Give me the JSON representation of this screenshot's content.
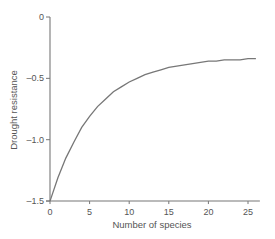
{
  "chart_data": {
    "type": "line",
    "title": "",
    "xlabel": "Number of species",
    "ylabel": "Drought resistance",
    "xlim": [
      0,
      26.5
    ],
    "ylim": [
      -1.5,
      0
    ],
    "xticks": [
      0,
      5,
      10,
      15,
      20,
      25
    ],
    "xtick_labels": [
      "0",
      "5",
      "10",
      "15",
      "20",
      "25"
    ],
    "yticks": [
      0,
      -0.5,
      -1.0,
      -1.5
    ],
    "ytick_labels": [
      "0",
      "–0.5",
      "–1.0",
      "–1.5"
    ],
    "grid": false,
    "legend": null,
    "series": [
      {
        "name": "Drought resistance",
        "color": "#777777",
        "x": [
          0,
          1,
          2,
          3,
          4,
          5,
          6,
          7,
          8,
          9,
          10,
          11,
          12,
          13,
          14,
          15,
          16,
          17,
          18,
          19,
          20,
          21,
          22,
          23,
          24,
          25,
          26
        ],
        "y": [
          -1.5,
          -1.31,
          -1.15,
          -1.02,
          -0.9,
          -0.81,
          -0.73,
          -0.67,
          -0.61,
          -0.57,
          -0.53,
          -0.5,
          -0.47,
          -0.45,
          -0.43,
          -0.41,
          -0.4,
          -0.39,
          -0.38,
          -0.37,
          -0.36,
          -0.36,
          -0.35,
          -0.35,
          -0.35,
          -0.34,
          -0.34
        ]
      }
    ]
  }
}
